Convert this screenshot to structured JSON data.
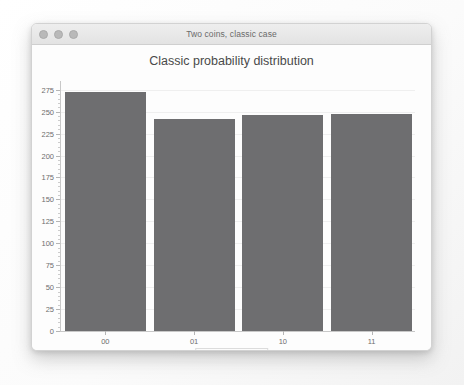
{
  "window": {
    "title": "Two coins, classic case",
    "traffic_lights": [
      "close-button",
      "minimize-button",
      "zoom-button"
    ]
  },
  "chart_data": {
    "type": "bar",
    "title": "Classic probability distribution",
    "xlabel": "",
    "ylabel": "",
    "categories": [
      "00",
      "01",
      "10",
      "11"
    ],
    "values": [
      272,
      242,
      246,
      247
    ],
    "series": [
      {
        "name": "occurrences",
        "values": [
          272,
          242,
          246,
          247
        ]
      }
    ],
    "ylim": [
      0,
      285
    ],
    "yticks": [
      0,
      25,
      50,
      75,
      100,
      125,
      150,
      175,
      200,
      225,
      250,
      275
    ],
    "ytick_labels": [
      "0",
      "25",
      "50",
      "75",
      "100",
      "125",
      "150",
      "175",
      "200",
      "225",
      "250",
      "275"
    ],
    "grid": true,
    "legend": {
      "position": "bottom",
      "entries": [
        {
          "label": "occurrences",
          "color": "#6e6e70"
        }
      ]
    },
    "bar_color": "#6e6e70"
  }
}
